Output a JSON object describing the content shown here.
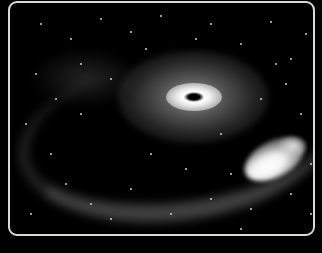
{
  "image": {
    "subject": "galaxy-with-bright-core-and-tidal-arm",
    "colors": {
      "background": "#000000",
      "frame_border": "#d9d9d9",
      "core_highlight": "#ffffff"
    }
  },
  "stars": [
    [
      30,
      20
    ],
    [
      60,
      35
    ],
    [
      90,
      15
    ],
    [
      120,
      28
    ],
    [
      150,
      12
    ],
    [
      200,
      20
    ],
    [
      230,
      40
    ],
    [
      260,
      18
    ],
    [
      280,
      55
    ],
    [
      295,
      30
    ],
    [
      25,
      70
    ],
    [
      45,
      95
    ],
    [
      70,
      110
    ],
    [
      100,
      75
    ],
    [
      210,
      130
    ],
    [
      250,
      95
    ],
    [
      275,
      80
    ],
    [
      290,
      110
    ],
    [
      40,
      150
    ],
    [
      80,
      200
    ],
    [
      120,
      185
    ],
    [
      160,
      210
    ],
    [
      200,
      195
    ],
    [
      240,
      205
    ],
    [
      280,
      190
    ],
    [
      300,
      210
    ],
    [
      15,
      120
    ],
    [
      140,
      150
    ],
    [
      175,
      165
    ],
    [
      300,
      160
    ],
    [
      55,
      180
    ],
    [
      100,
      215
    ],
    [
      220,
      170
    ],
    [
      265,
      60
    ],
    [
      185,
      35
    ],
    [
      135,
      45
    ],
    [
      20,
      210
    ],
    [
      310,
      90
    ],
    [
      230,
      225
    ],
    [
      70,
      60
    ]
  ]
}
